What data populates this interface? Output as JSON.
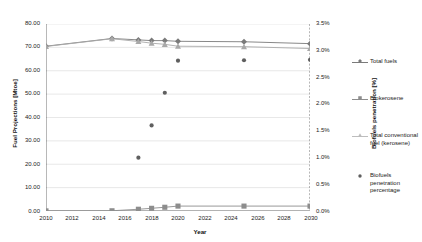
{
  "chart_data": {
    "type": "line",
    "title": "",
    "xlabel": "Year",
    "ylabel": "Fuel Projections [Mtoe]",
    "y2label": "Biofuels penetration [%]",
    "xlim": [
      2010,
      2030
    ],
    "ylim": [
      0.0,
      80.0
    ],
    "y2lim": [
      0.0,
      3.5
    ],
    "grid": true,
    "legend_position": "right",
    "x_ticks": [
      "2010",
      "2012",
      "2014",
      "2016",
      "2018",
      "2020",
      "2022",
      "2024",
      "2026",
      "2028",
      "2030"
    ],
    "y_ticks_left": [
      "0.00",
      "10.00",
      "20.00",
      "30.00",
      "40.00",
      "50.00",
      "60.00",
      "70.00",
      "80.00"
    ],
    "y_ticks_right": [
      "0.0%",
      "0.5%",
      "1.0%",
      "1.5%",
      "2.0%",
      "2.5%",
      "3.0%",
      "3.5%"
    ],
    "x": [
      2010,
      2015,
      2017,
      2018,
      2019,
      2020,
      2025,
      2030
    ],
    "series": [
      {
        "name": "Total fuels",
        "axis": "left",
        "color": "#7a7a7a",
        "marker": "diamond",
        "values": [
          70.5,
          73.8,
          73.2,
          72.9,
          72.9,
          72.6,
          72.4,
          71.6
        ]
      },
      {
        "name": "Biokerosene",
        "axis": "left",
        "color": "#8d8d8d",
        "marker": "square",
        "values": [
          0.05,
          0.1,
          0.75,
          1.15,
          1.6,
          2.1,
          2.1,
          2.1
        ]
      },
      {
        "name": "Total conventional fuel (kerosene)",
        "axis": "left",
        "color": "#a9a9a9",
        "marker": "triangle",
        "values": [
          70.4,
          73.7,
          72.5,
          71.8,
          71.3,
          70.5,
          70.3,
          69.5
        ]
      },
      {
        "name": "Biofuels penetration percentage",
        "axis": "right",
        "color": "#5f5f5f",
        "marker": "dot",
        "x": [
          2017,
          2018,
          2019,
          2020,
          2025,
          2030
        ],
        "values": [
          1.0,
          1.6,
          2.2,
          2.81,
          2.82,
          2.83
        ],
        "values_left_scale": [
          22.8,
          36.6,
          50.6,
          64.3,
          64.5,
          64.7
        ]
      }
    ]
  },
  "legend": {
    "items": [
      {
        "label": "Total fuels",
        "marker": "diamond",
        "color": "#7a7a7a",
        "has_line": true
      },
      {
        "label": "Biokerosene",
        "marker": "square",
        "color": "#8d8d8d",
        "has_line": true
      },
      {
        "label": "Total conventional fuel (kerosene)",
        "marker": "triangle",
        "color": "#a9a9a9",
        "has_line": true
      },
      {
        "label": "Biofuels penetration percentage",
        "marker": "dot",
        "color": "#5f5f5f",
        "has_line": false
      }
    ]
  },
  "colors": {
    "grid": "#d9d9d9",
    "axis": "#808080",
    "text": "#222222",
    "background": "#ffffff"
  }
}
